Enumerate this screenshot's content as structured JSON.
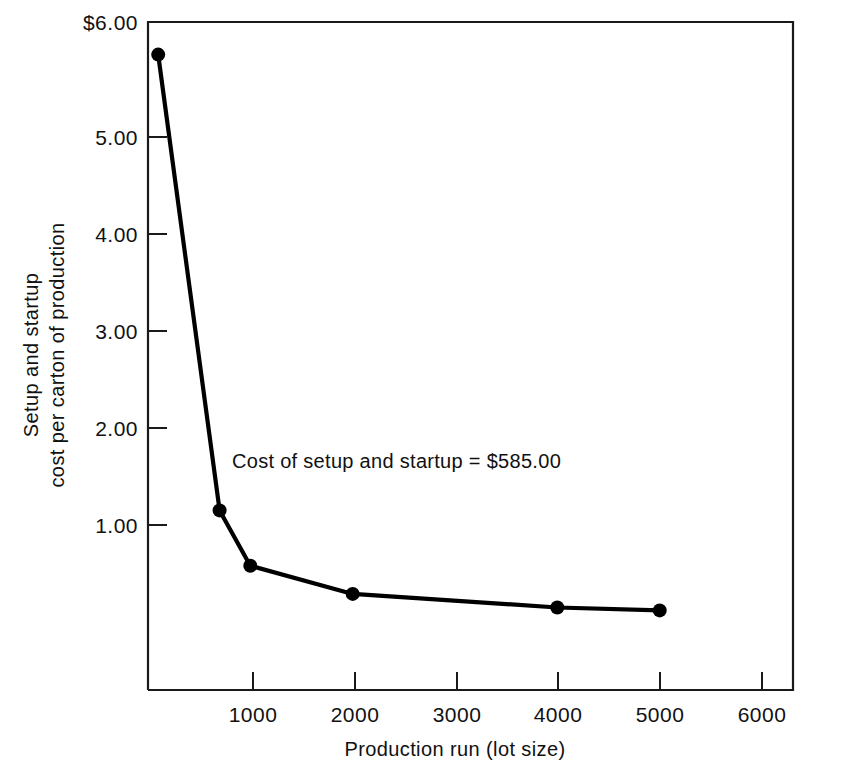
{
  "chart_data": {
    "type": "line",
    "title": "",
    "xlabel": "Production run (lot size)",
    "ylabel_line1": "Setup and startup",
    "ylabel_line2": "cost per carton of production",
    "annotation": "Cost of setup and startup = $585.00",
    "xlim": [
      0,
      6000
    ],
    "ylim": [
      0,
      6.0
    ],
    "grid": false,
    "legend": false,
    "x_ticks": [
      1000,
      2000,
      3000,
      4000,
      5000,
      6000
    ],
    "x_tick_labels": [
      "1000",
      "2000",
      "3000",
      "4000",
      "5000",
      "6000"
    ],
    "y_ticks": [
      1.0,
      2.0,
      3.0,
      4.0,
      5.0,
      6.0
    ],
    "y_tick_labels": [
      "1.00",
      "2.00",
      "3.00",
      "4.00",
      "5.00",
      "$6.00"
    ],
    "series": [
      {
        "name": "Setup and startup cost per carton",
        "x": [
          100,
          700,
          1000,
          2000,
          4000,
          5000
        ],
        "values": [
          5.85,
          1.15,
          0.58,
          0.29,
          0.15,
          0.12
        ]
      }
    ],
    "markers": "filled-circle",
    "marker_color": "#000000",
    "line_color": "#000000"
  },
  "axis_labels": {
    "y_top": "$6.00",
    "y_5": "5.00",
    "y_4": "4.00",
    "y_3": "3.00",
    "y_2": "2.00",
    "y_1": "1.00",
    "x_1000": "1000",
    "x_2000": "2000",
    "x_3000": "3000",
    "x_4000": "4000",
    "x_5000": "5000",
    "x_6000": "6000"
  },
  "titles": {
    "x_axis": "Production run (lot size)",
    "y_axis_line1": "Setup and startup",
    "y_axis_line2": "cost per carton of production",
    "annotation": "Cost of setup and startup = $585.00"
  }
}
